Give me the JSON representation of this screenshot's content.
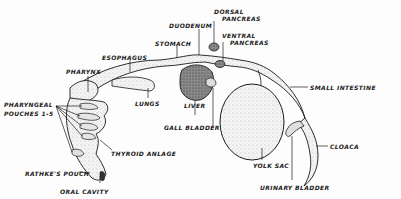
{
  "diagram": {
    "title": "",
    "labels": {
      "dorsal_pancreas": [
        "DORSAL",
        "PANCREAS"
      ],
      "ventral_pancreas": [
        "VENTRAL",
        "PANCREAS"
      ],
      "duodenum": "DUODENUM",
      "stomach": "STOMACH",
      "esophagus": "ESOPHAGUS",
      "pharynx": "PHARYNX",
      "pharyngeal_pouches": [
        "PHARYNGEAL",
        "POUCHES 1-5"
      ],
      "lungs": "LUNGS",
      "liver": "LIVER",
      "gall_bladder": "GALL BLADDER",
      "small_intestine": "SMALL INTESTINE",
      "thyroid_anlage": "THYROID ANLAGE",
      "yolk_sac": "YOLK SAC",
      "cloaca": "CLOACA",
      "rathkes_pouch": "RATHKE'S POUCH",
      "urinary_bladder": "URINARY BLADDER",
      "oral_cavity": "ORAL CAVITY"
    },
    "colors": {
      "ink": "#1a1a1a",
      "stipple": "#bfbfbf",
      "dark_organ": "#555555",
      "background": "#fdfdfd"
    }
  }
}
